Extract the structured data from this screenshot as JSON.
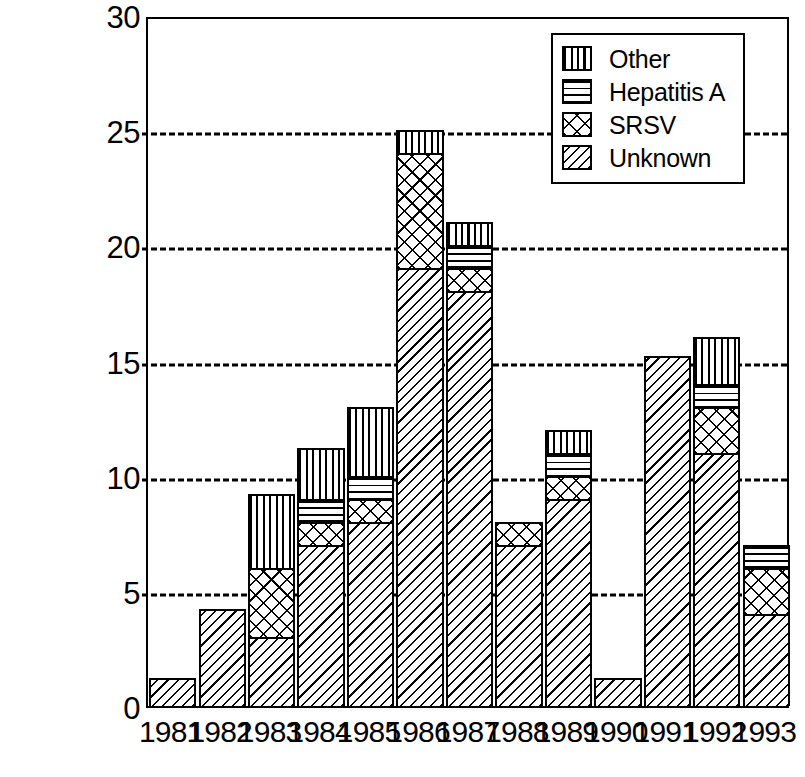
{
  "chart_data": {
    "type": "bar",
    "subtype": "stacked-bar",
    "title": "",
    "subtitle": "",
    "xlabel": "",
    "ylabel": "",
    "categories": [
      "1981",
      "1982",
      "1983",
      "1984",
      "1985",
      "1986",
      "1987",
      "1988",
      "1989",
      "1990",
      "1991",
      "1992",
      "1993"
    ],
    "series": [
      {
        "name": "Unknown",
        "pattern": "diagonal-hatch",
        "values": [
          1.2,
          4.2,
          3,
          7,
          8,
          19,
          18,
          7,
          9,
          1.2,
          15.2,
          11,
          4
        ]
      },
      {
        "name": "SRSV",
        "pattern": "cross-hatch",
        "values": [
          0,
          0,
          3,
          1,
          1,
          5,
          1,
          1,
          1,
          0,
          0,
          2,
          2
        ]
      },
      {
        "name": "Hepatitis A",
        "pattern": "horizontal-lines",
        "values": [
          0,
          0,
          0,
          1,
          1,
          0,
          1,
          0,
          1,
          0,
          0,
          1,
          1
        ]
      },
      {
        "name": "Other",
        "pattern": "vertical-lines",
        "values": [
          0,
          0,
          3.2,
          2.2,
          3,
          1,
          1,
          0,
          1,
          0,
          0,
          2,
          0
        ]
      }
    ],
    "totals": [
      1.2,
      4.2,
      9.2,
      11.2,
      13,
      25,
      21,
      8,
      12,
      1.2,
      15.2,
      16,
      7
    ],
    "ylim": [
      0,
      30
    ],
    "yticks": [
      0,
      5,
      10,
      15,
      20,
      25,
      30
    ],
    "ytick_labels": [
      "0",
      "5",
      "10",
      "15",
      "20",
      "25",
      "30"
    ],
    "grid": "horizontal-dashed-at-5-10-15-20-25",
    "legend_position": "top-right",
    "colors": {
      "foreground": "#000000",
      "background": "#ffffff"
    }
  },
  "legend": {
    "items": [
      {
        "label": "Other",
        "pattern": "vertical-lines"
      },
      {
        "label": "Hepatitis A",
        "pattern": "horizontal-lines"
      },
      {
        "label": "SRSV",
        "pattern": "cross-hatch"
      },
      {
        "label": "Unknown",
        "pattern": "diagonal-hatch"
      }
    ]
  }
}
